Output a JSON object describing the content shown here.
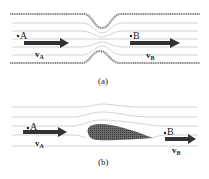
{
  "figure": {
    "panels": [
      {
        "id": "a",
        "caption": "(a)",
        "description": "Flow through a pipe with a constriction",
        "point_a": {
          "label": "A",
          "velocity_label": "v",
          "velocity_sub": "A"
        },
        "point_b": {
          "label": "B",
          "velocity_label": "v",
          "velocity_sub": "B"
        }
      },
      {
        "id": "b",
        "caption": "(b)",
        "description": "Flow past an airfoil",
        "point_a": {
          "label": "A",
          "velocity_label": "v",
          "velocity_sub": "A"
        },
        "point_b": {
          "label": "B",
          "velocity_label": "v",
          "velocity_sub": "B"
        }
      }
    ],
    "colors": {
      "wall": "#8a8a8a",
      "streamline": "#c8c8c8",
      "arrow": "#333333",
      "airfoil": "#555555",
      "text": "#222222"
    }
  }
}
